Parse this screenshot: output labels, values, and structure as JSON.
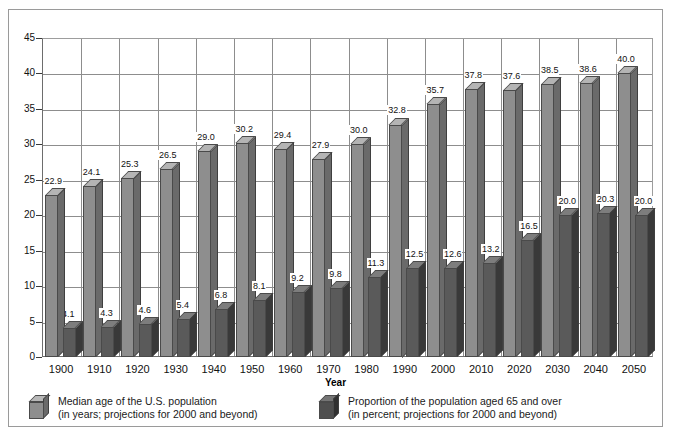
{
  "chart_data": {
    "type": "bar",
    "title": "",
    "subtitle": "",
    "xlabel": "Year",
    "ylabel": "",
    "ylim": [
      0,
      45
    ],
    "ytick_step": 5,
    "yticks": [
      0,
      5,
      10,
      15,
      20,
      25,
      30,
      35,
      40,
      45
    ],
    "grid": true,
    "legend_position": "bottom",
    "categories": [
      "1900",
      "1910",
      "1920",
      "1930",
      "1940",
      "1950",
      "1960",
      "1970",
      "1980",
      "1990",
      "2000",
      "2010",
      "2020",
      "2030",
      "2040",
      "2050"
    ],
    "series": [
      {
        "name": "Median age of the U.S. population (in years; projections for 2000 and beyond)",
        "short_name": "Median age",
        "color": "#8e8e8e",
        "values": [
          22.9,
          24.1,
          25.3,
          26.5,
          29.0,
          30.2,
          29.4,
          27.9,
          30.0,
          32.8,
          35.7,
          37.8,
          37.6,
          38.5,
          38.6,
          40.0
        ],
        "labels": [
          "22.9",
          "24.1",
          "25.3",
          "26.5",
          "29.0",
          "30.2",
          "29.4",
          "27.9",
          "30.0",
          "32.8",
          "35.7",
          "37.8",
          "37.6",
          "38.5",
          "38.6",
          "40.0"
        ]
      },
      {
        "name": "Proportion of the population aged 65 and over (in percent; projections for 2000 and beyond)",
        "short_name": "Proportion 65 and over",
        "color": "#5a5a5a",
        "values": [
          4.1,
          4.3,
          4.6,
          5.4,
          6.8,
          8.1,
          9.2,
          9.8,
          11.3,
          12.5,
          12.6,
          13.2,
          16.5,
          20.0,
          20.3,
          20.0
        ],
        "labels": [
          "4.1",
          "4.3",
          "4.6",
          "5.4",
          "6.8",
          "8.1",
          "9.2",
          "9.8",
          "11.3",
          "12.5",
          "12.6",
          "13.2",
          "16.5",
          "20.0",
          "20.3",
          "20.0"
        ]
      }
    ]
  },
  "legend": {
    "entries": [
      {
        "line1": "Median age of the U.S. population",
        "line2": "(in years; projections for 2000 and beyond)"
      },
      {
        "line1": "Proportion of the population aged 65 and over",
        "line2": "(in percent; projections for 2000 and beyond)"
      }
    ]
  }
}
